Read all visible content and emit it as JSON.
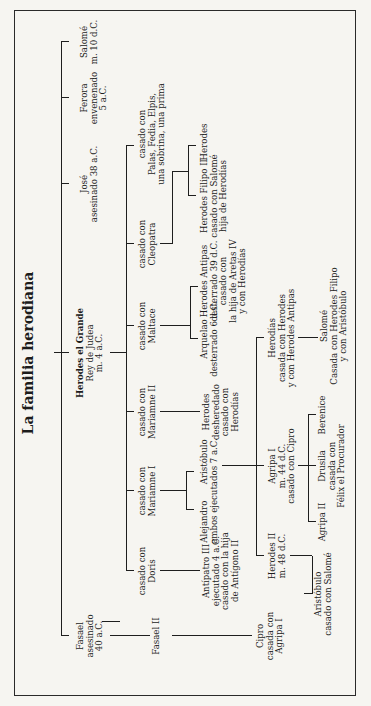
{
  "diagram": {
    "title": "La familia herodiana",
    "nodes": {
      "fasael": [
        "Fasael",
        "asesinado",
        "40 a.C."
      ],
      "herodes_grande": [
        "Herodes el Grande",
        "Rey de Judea",
        "m. 4 a.C."
      ],
      "jose": [
        "José",
        "asesinado 38 a.C."
      ],
      "ferora": [
        "Ferora",
        "envenenado",
        "5 a.C."
      ],
      "salome_hermana": [
        "Salomé",
        "m. 10 d.C."
      ],
      "fasael_ii": [
        "Fasael II"
      ],
      "wife_doris": [
        "casado con",
        "Doris"
      ],
      "wife_mariamne_i": [
        "casado con",
        "Mariamne I"
      ],
      "wife_mariamne_ii": [
        "casado con",
        "Mariamne II"
      ],
      "wife_maltace": [
        "casado con",
        "Maltace"
      ],
      "wife_cleopatra": [
        "casado con",
        "Cleopatra"
      ],
      "wife_others": [
        "casado con",
        "Palas, Fedia, Elpis,",
        "una sobrina, una prima"
      ],
      "cipro": [
        "Cipro",
        "casada con",
        "Agripa I"
      ],
      "antipatro_iii": [
        "Antípatro III",
        "ejecutado 4 a.C.",
        "casado con la hija",
        "de Antígono II"
      ],
      "alejandro_aristobulo": [
        "Alejandro      Aristóbulo",
        "ambos ejecutados 7 a.C."
      ],
      "herodes_desheredado": [
        "Herodes",
        "desheredado",
        "casado con",
        "Herodías"
      ],
      "arquelao": [
        "Arquelao",
        "desterrado 6 d.C."
      ],
      "herodes_antipas": [
        "Herodes Antipas",
        "desterrado 39 d.C.",
        "casado con",
        "la hija de Aretas IV",
        "y con Herodías"
      ],
      "herodes_filipo_ii": [
        "Herodes Filipo II",
        "casado con Salomé",
        "hija de Herodías"
      ],
      "herodes_son": [
        "Herodes"
      ],
      "herodes_ii": [
        "Herodes II",
        "m. 48 d.C."
      ],
      "agripa_i": [
        "Agripa I",
        "m. 44 d.C.",
        "casado con Cipro"
      ],
      "herodias": [
        "Herodías",
        "casada con Herodes",
        "y con Herodes Antipas"
      ],
      "aristobulo_nieto": [
        "Aristóbulo",
        "casado con Salomé"
      ],
      "agripa_ii": [
        "Agripa II"
      ],
      "drusila": [
        "Drusila",
        "casada con",
        "Félix el Procurador"
      ],
      "berenice": [
        "Berenice"
      ],
      "salome_hija": [
        "Salomé",
        "Casada con Herodes Filipo",
        "y con Aristóbulo"
      ]
    }
  }
}
